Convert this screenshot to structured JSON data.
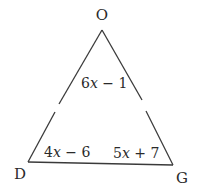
{
  "diagram": {
    "type": "triangle",
    "vertices": [
      {
        "label": "O",
        "position": "top"
      },
      {
        "label": "D",
        "position": "bottom-left"
      },
      {
        "label": "G",
        "position": "bottom-right"
      }
    ],
    "angles": [
      {
        "vertex": "O",
        "coef": "6",
        "var": "x",
        "rest": " − 1"
      },
      {
        "vertex": "D",
        "coef": "4",
        "var": "x",
        "rest": " − 6"
      },
      {
        "vertex": "G",
        "coef": "5",
        "var": "x",
        "rest": " + 7"
      }
    ],
    "colors": {
      "stroke": "#3a3a3a",
      "text": "#2a2a2a",
      "background": "#ffffff"
    }
  }
}
